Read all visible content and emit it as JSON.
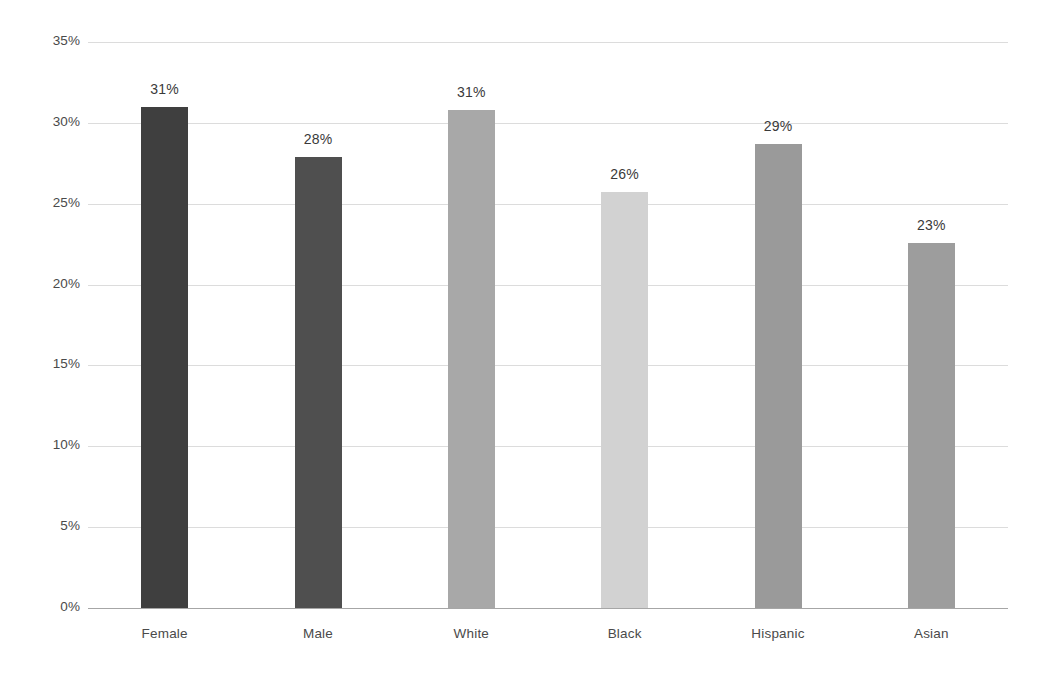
{
  "chart_data": {
    "type": "bar",
    "title": "",
    "subtitle": "",
    "xlabel": "",
    "ylabel": "",
    "categories": [
      "Female",
      "Male",
      "White",
      "Black",
      "Hispanic",
      "Asian"
    ],
    "values": [
      31,
      28,
      31,
      26,
      29,
      23
    ],
    "plotted_values": [
      31.0,
      27.9,
      30.8,
      25.7,
      28.7,
      22.6
    ],
    "data_labels": [
      "31%",
      "28%",
      "31%",
      "26%",
      "29%",
      "23%"
    ],
    "bar_colors": [
      "#3f3f3f",
      "#4f4f4f",
      "#a8a8a8",
      "#d2d2d2",
      "#9a9a9a",
      "#9d9d9d"
    ],
    "ylim": [
      0,
      35
    ],
    "ytick_values": [
      35,
      30,
      25,
      20,
      15,
      10,
      5,
      0
    ],
    "ytick_labels": [
      "35%",
      "30%",
      "25%",
      "20%",
      "15%",
      "10%",
      "5%",
      "0%"
    ],
    "grid": "horizontal",
    "gridline_color": "#d6d6d6",
    "baseline_color": "#a6a6a6",
    "legend": "none",
    "legend_position": "none",
    "background_color": "#ffffff",
    "label_text_color": "#4a4a4a",
    "value_text_color": "#3a3a3a"
  }
}
